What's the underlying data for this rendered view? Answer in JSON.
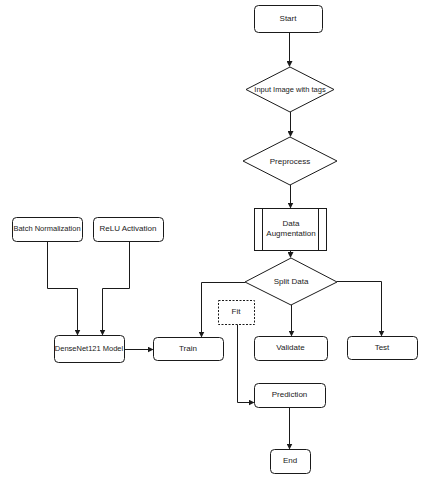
{
  "diagram": {
    "type": "flowchart",
    "colors": {
      "stroke": "#1a1a1a",
      "fill": "#ffffff",
      "text": "#1a1a1a"
    },
    "nodes": {
      "start": {
        "label": "Start",
        "shape": "rounded-rect"
      },
      "input_image": {
        "label": "Input Image with tags",
        "shape": "diamond"
      },
      "preprocess": {
        "label": "Preprocess",
        "shape": "diamond"
      },
      "data_augmentation": {
        "label": "Data Augmentation",
        "shape": "predefined-process"
      },
      "split_data": {
        "label": "Split Data",
        "shape": "diamond"
      },
      "train": {
        "label": "Train",
        "shape": "rounded-rect"
      },
      "fit": {
        "label": "Fit",
        "shape": "dashed-rect"
      },
      "validate": {
        "label": "Validate",
        "shape": "rounded-rect"
      },
      "test": {
        "label": "Test",
        "shape": "rounded-rect"
      },
      "batch_normalization": {
        "label": "Batch Normalization",
        "shape": "rounded-rect"
      },
      "relu_activation": {
        "label": "ReLU Activation",
        "shape": "rounded-rect"
      },
      "densenet_model": {
        "label": "DenseNet121 Model",
        "shape": "rounded-rect"
      },
      "prediction": {
        "label": "Prediction",
        "shape": "rounded-rect"
      },
      "end": {
        "label": "End",
        "shape": "rounded-rect"
      }
    },
    "edges": [
      {
        "from": "Start",
        "to": "Input Image with tags"
      },
      {
        "from": "Input Image with tags",
        "to": "Preprocess"
      },
      {
        "from": "Preprocess",
        "to": "Data Augmentation"
      },
      {
        "from": "Data Augmentation",
        "to": "Split Data"
      },
      {
        "from": "Split Data",
        "to": "Train"
      },
      {
        "from": "Split Data",
        "to": "Validate"
      },
      {
        "from": "Split Data",
        "to": "Test"
      },
      {
        "from": "Batch Normalization",
        "to": "DenseNet121 Model"
      },
      {
        "from": "ReLU Activation",
        "to": "DenseNet121 Model"
      },
      {
        "from": "DenseNet121 Model",
        "to": "Train"
      },
      {
        "from": "Fit",
        "to": "Prediction"
      },
      {
        "from": "Prediction",
        "to": "End"
      }
    ]
  }
}
